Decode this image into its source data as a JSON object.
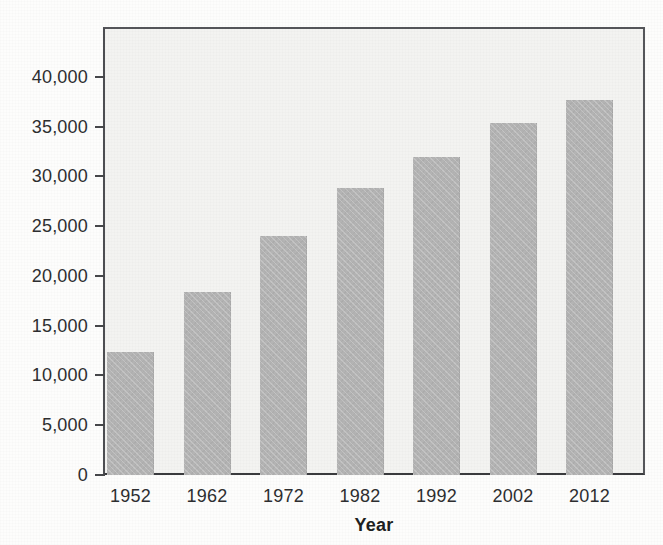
{
  "figure": {
    "background_color": "#fdfdfc",
    "plot_background_color": "#f3f3f1",
    "bar_color": "#b4b4b4",
    "axis_color": "#46474a",
    "text_color": "#2d2e30"
  },
  "chart_data": {
    "type": "bar",
    "title": "",
    "subtitle": "",
    "xlabel": "Year",
    "ylabel": "",
    "categories": [
      "1952",
      "1962",
      "1972",
      "1982",
      "1992",
      "2002",
      "2012"
    ],
    "values": [
      12400,
      18400,
      24000,
      28800,
      31900,
      35400,
      37700
    ],
    "ylim": [
      0,
      45000
    ],
    "ytick_values": [
      0,
      5000,
      10000,
      15000,
      20000,
      25000,
      30000,
      35000,
      40000
    ],
    "ytick_labels": [
      "0",
      "5,000",
      "10,000",
      "15,000",
      "20,000",
      "25,000",
      "30,000",
      "35,000",
      "40,000"
    ],
    "grid": false,
    "legend": null,
    "legend_position": "none",
    "annotations": []
  },
  "ghost_text": {
    "line1": "",
    "line2": ""
  }
}
